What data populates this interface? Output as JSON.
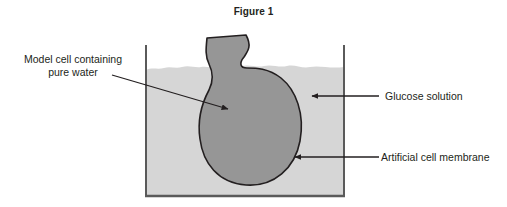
{
  "figure": {
    "title": "Figure 1",
    "caption_position": "top-center"
  },
  "labels": {
    "model_cell": "Model cell containing\npure water",
    "glucose": "Glucose solution",
    "membrane": "Artificial cell membrane"
  },
  "diagram": {
    "type": "osmosis-model-cell-in-beaker",
    "beaker": {
      "name": "beaker",
      "left_wall_x": 145,
      "right_wall_x": 344,
      "top_y": 45,
      "bottom_y": 197,
      "wall_color": "#5a5a5a",
      "wall_thickness": 2
    },
    "solution": {
      "name": "glucose-solution",
      "fill_color": "#d6d6d6",
      "surface_y": 67,
      "surface_style": "wavy"
    },
    "cell": {
      "name": "model-cell",
      "fill_color": "#969696",
      "outline_color": "#231f20",
      "outline_thickness": 1.6,
      "bulb_top_y": 70,
      "bulb_bottom_y": 186,
      "bulb_left_x": 200,
      "bulb_right_x": 301,
      "tube_top_y": 35,
      "tube_left_x": 207,
      "tube_right_x": 246
    },
    "arrows": [
      {
        "name": "model-cell-arrow",
        "from_x": 112,
        "from_y": 75,
        "to_x": 230,
        "to_y": 110,
        "color": "#231f20"
      },
      {
        "name": "glucose-arrow",
        "from_x": 379,
        "from_y": 96,
        "to_x": 310,
        "to_y": 96,
        "color": "#231f20"
      },
      {
        "name": "membrane-arrow",
        "from_x": 379,
        "from_y": 157,
        "to_x": 293,
        "to_y": 157,
        "color": "#231f20"
      }
    ]
  }
}
